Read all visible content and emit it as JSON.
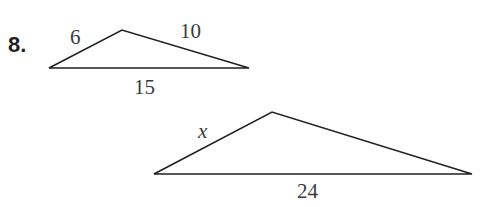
{
  "problem": {
    "number": "8.",
    "triangle_small": {
      "side_left": "6",
      "side_right": "10",
      "side_base": "15"
    },
    "triangle_large": {
      "side_left": "x",
      "side_base": "24"
    }
  }
}
